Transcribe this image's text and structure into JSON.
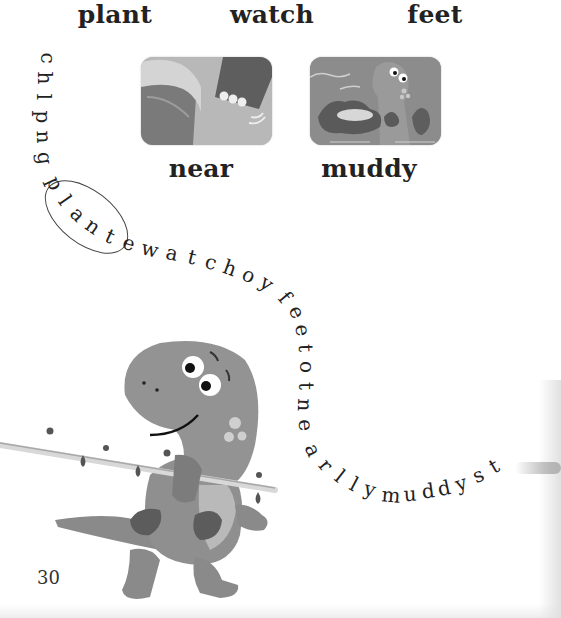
{
  "word_bank": {
    "words": [
      {
        "text": "plant"
      },
      {
        "text": "watch"
      },
      {
        "text": "feet"
      },
      {
        "text": "near"
      },
      {
        "text": "muddy"
      }
    ]
  },
  "pictures": [
    {
      "name": "near-picture",
      "caption": "near"
    },
    {
      "name": "muddy-picture",
      "caption": "muddy"
    }
  ],
  "letter_chain": {
    "sequence": "chlpngplantewatchoyfeetotnearllymuddyst",
    "letters": [
      "c",
      "h",
      "l",
      "p",
      "n",
      "g",
      "p",
      "l",
      "a",
      "n",
      "t",
      "e",
      "w",
      "a",
      "t",
      "c",
      "h",
      "o",
      "y",
      "f",
      "e",
      "e",
      "t",
      "o",
      "t",
      "n",
      "e",
      "a",
      "r",
      "l",
      "l",
      "y",
      "m",
      "u",
      "d",
      "d",
      "y",
      "s",
      "t"
    ],
    "circled_word": "plant"
  },
  "page_number": "30",
  "colors": {
    "background": "#ffffff",
    "text": "#222222",
    "illustration_gray": "#8a8a8a"
  }
}
